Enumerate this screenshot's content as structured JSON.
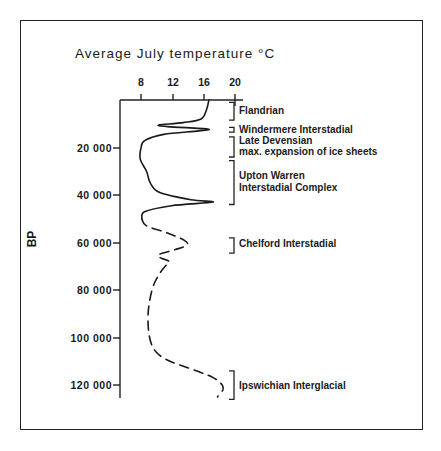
{
  "chart_data": {
    "type": "line",
    "title": "Average July temperature °C",
    "xlabel": "Average July temperature °C",
    "ylabel": "BP",
    "x_axis": {
      "position": "top",
      "ticks": [
        8,
        12,
        16,
        20
      ],
      "range": [
        5.4,
        20.5
      ]
    },
    "y_axis": {
      "inverted": true,
      "ticks": [
        20000,
        40000,
        60000,
        80000,
        100000,
        120000
      ],
      "tick_labels": [
        "20 000",
        "40 000",
        "60 000",
        "80 000",
        "100 000",
        "120 000"
      ],
      "range": [
        0,
        125000
      ]
    },
    "grid": false,
    "legend": null,
    "series": [
      {
        "name": "Temperature (solid, well-dated)",
        "style": "solid",
        "points": [
          [
            0,
            16.8
          ],
          [
            4000,
            16.5
          ],
          [
            8000,
            15.8
          ],
          [
            9500,
            13.5
          ],
          [
            10500,
            10.4
          ],
          [
            11200,
            11.5
          ],
          [
            12200,
            16.6
          ],
          [
            13000,
            15.5
          ],
          [
            14500,
            11
          ],
          [
            17000,
            8.6
          ],
          [
            20000,
            8.1
          ],
          [
            25000,
            8.0
          ],
          [
            30000,
            8.8
          ],
          [
            35000,
            9.3
          ],
          [
            39000,
            10.5
          ],
          [
            42000,
            14.5
          ],
          [
            43000,
            17.3
          ],
          [
            44500,
            12
          ],
          [
            47000,
            8.6
          ],
          [
            50000,
            8.2
          ]
        ]
      },
      {
        "name": "Temperature (dashed, uncertain)",
        "style": "dashed",
        "points": [
          [
            50000,
            8.2
          ],
          [
            53000,
            8.8
          ],
          [
            56000,
            11.5
          ],
          [
            59000,
            13.6
          ],
          [
            61000,
            14
          ],
          [
            63000,
            12.5
          ],
          [
            65000,
            10.4
          ],
          [
            66500,
            10.6
          ],
          [
            68000,
            11.7
          ],
          [
            70000,
            11.2
          ],
          [
            74000,
            10.3
          ],
          [
            80000,
            9.5
          ],
          [
            90000,
            9.0
          ],
          [
            100000,
            9.2
          ],
          [
            106000,
            10.0
          ],
          [
            110000,
            11.8
          ],
          [
            114000,
            15.2
          ],
          [
            117000,
            17.4
          ],
          [
            120000,
            18.5
          ],
          [
            122000,
            18.6
          ],
          [
            124000,
            18.1
          ],
          [
            125000,
            17.9
          ]
        ]
      }
    ],
    "annotations": [
      {
        "label": "Flandrian",
        "from": 1000,
        "to": 8500
      },
      {
        "label": "Windermere Interstadial",
        "from": 11500,
        "to": 13500
      },
      {
        "label": "Late Devensian max. expansion of ice sheets",
        "from": 15500,
        "to": 24000
      },
      {
        "label": "Upton Warren Interstadial Complex",
        "from": 25500,
        "to": 44000
      },
      {
        "label": "Chelford Interstadial",
        "from": 58000,
        "to": 64500
      },
      {
        "label": "Ipswichian Interglacial",
        "from": 114000,
        "to": 126000
      }
    ]
  },
  "labels": {
    "title": "Average July temperature °C",
    "ylabel": "BP",
    "xticks": [
      "8",
      "12",
      "16",
      "20"
    ],
    "yticks": [
      "20 000",
      "40 000",
      "60 000",
      "80 000",
      "100 000",
      "120 000"
    ],
    "periods": {
      "flandrian": "Flandrian",
      "windermere": "Windermere Interstadial",
      "late_devensian_1": "Late Devensian",
      "late_devensian_2": "max. expansion of ice sheets",
      "upton_1": "Upton Warren",
      "upton_2": "Interstadial Complex",
      "chelford": "Chelford Interstadial",
      "ipswichian": "Ipswichian Interglacial"
    }
  }
}
